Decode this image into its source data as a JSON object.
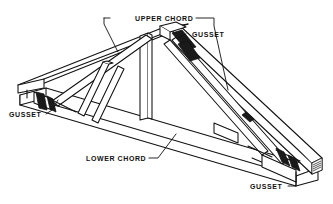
{
  "figure": {
    "background_color": "#ffffff",
    "line_color": "#111111",
    "fill_color": "#ffffff",
    "plate_color": "#1a1a1a"
  },
  "labels": {
    "upper_chord": "UPPER CHORD",
    "lower_chord": "LOWER CHORD",
    "gusset_peak": "GUSSET",
    "gusset_left": "GUSSET",
    "gusset_right": "GUSSET"
  },
  "parts": {
    "upper_chord_name": "upper-chord",
    "lower_chord_name": "lower-chord",
    "web_member_name": "web-member",
    "gusset_plate_name": "gusset-plate",
    "king_post_name": "king-post"
  }
}
